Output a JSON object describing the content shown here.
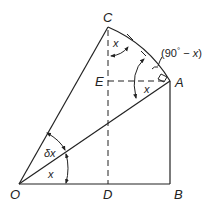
{
  "diagram": {
    "type": "geometry",
    "points": {
      "O": "O",
      "A": "A",
      "B": "B",
      "C": "C",
      "D": "D",
      "E": "E"
    },
    "angle_labels": {
      "x_bottom": "x",
      "delta_x": "δx",
      "x_near_A": "x",
      "x_near_C": "x",
      "complement_prefix": "(90",
      "complement_degree": "°",
      "complement_suffix": " − ",
      "complement_var": "x",
      "complement_close": ")"
    },
    "colors": {
      "stroke": "#222222",
      "background": "#ffffff"
    }
  }
}
